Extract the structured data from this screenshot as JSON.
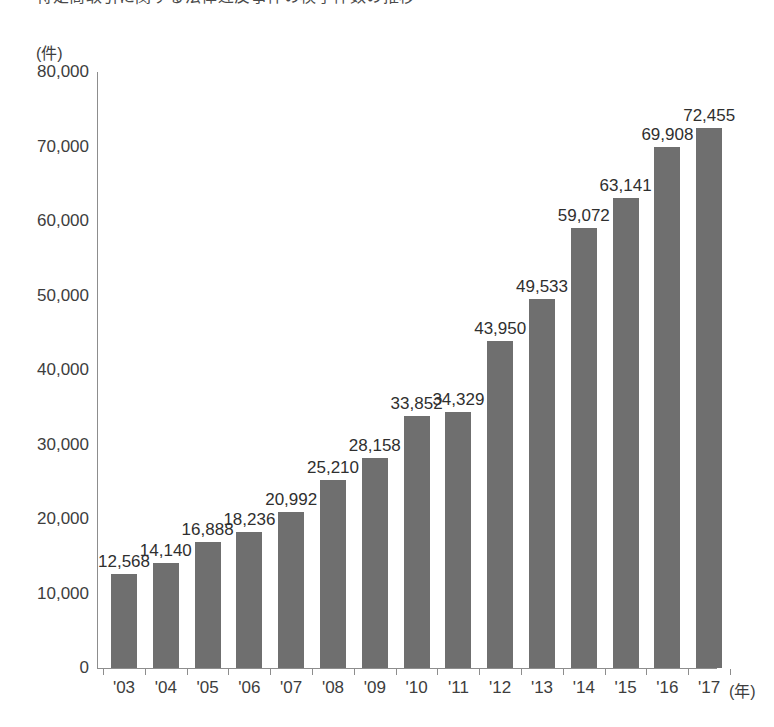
{
  "title": {
    "text": "特定商取引に関する法律違反事件の検挙件数の推移",
    "visible_note": "clipped at top edge"
  },
  "chart_data": {
    "type": "bar",
    "title": "",
    "xlabel": "(年)",
    "ylabel": "(件)",
    "categories": [
      "'03",
      "'04",
      "'05",
      "'06",
      "'07",
      "'08",
      "'09",
      "'10",
      "'11",
      "'12",
      "'13",
      "'14",
      "'15",
      "'16",
      "'17"
    ],
    "values": [
      12568,
      14140,
      16888,
      18236,
      20992,
      25210,
      28158,
      33852,
      34329,
      43950,
      49533,
      59072,
      63141,
      69908,
      72455
    ],
    "value_labels": [
      "12,568",
      "14,140",
      "16,888",
      "18,236",
      "20,992",
      "25,210",
      "28,158",
      "33,852",
      "34,329",
      "43,950",
      "49,533",
      "59,072",
      "63,141",
      "69,908",
      "72,455"
    ],
    "ylim": [
      0,
      80000
    ],
    "ytick_values": [
      0,
      10000,
      20000,
      30000,
      40000,
      50000,
      60000,
      70000,
      80000
    ],
    "ytick_labels": [
      "0",
      "10,000",
      "20,000",
      "30,000",
      "40,000",
      "50,000",
      "60,000",
      "70,000",
      "80,000"
    ],
    "grid": false,
    "legend": null,
    "bar_color": "#6f6f6f",
    "axis_color": "#8d8d8d",
    "background": "#ffffff"
  }
}
